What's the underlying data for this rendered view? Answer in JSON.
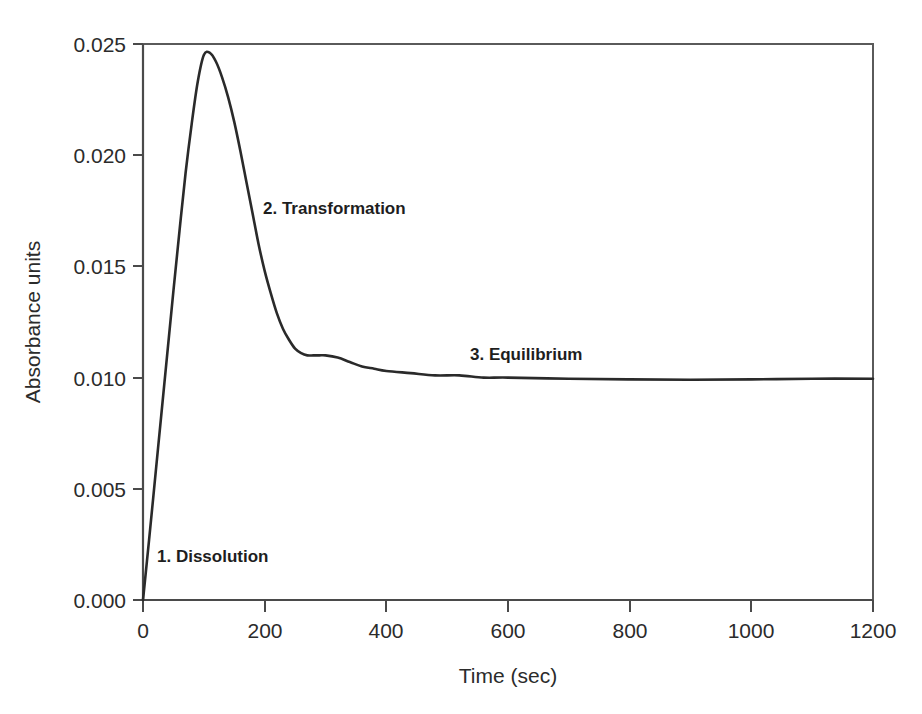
{
  "chart_data": {
    "type": "line",
    "title": "",
    "xlabel": "Time (sec)",
    "ylabel": "Absorbance units",
    "xlim": [
      0,
      1200
    ],
    "ylim": [
      0.0,
      0.025
    ],
    "grid": false,
    "legend": false,
    "x_ticks": [
      0,
      200,
      400,
      600,
      800,
      1000,
      1200
    ],
    "x_tick_labels": [
      "0",
      "200",
      "400",
      "600",
      "800",
      "1000",
      "1200"
    ],
    "y_ticks": [
      0.0,
      0.005,
      0.01,
      0.015,
      0.02,
      0.025
    ],
    "y_tick_labels": [
      "0.000",
      "0.005",
      "0.010",
      "0.015",
      "0.020",
      "0.025"
    ],
    "series": [
      {
        "name": "Absorbance",
        "x": [
          0,
          10,
          20,
          30,
          40,
          50,
          60,
          70,
          80,
          90,
          100,
          110,
          120,
          130,
          140,
          150,
          160,
          170,
          180,
          190,
          200,
          210,
          220,
          230,
          240,
          250,
          260,
          270,
          280,
          290,
          300,
          320,
          340,
          360,
          380,
          400,
          440,
          480,
          520,
          560,
          600,
          700,
          800,
          900,
          1000,
          1100,
          1200
        ],
        "y": [
          0.0,
          0.0027,
          0.0055,
          0.0083,
          0.0111,
          0.0139,
          0.0166,
          0.0192,
          0.0214,
          0.0233,
          0.0245,
          0.0246,
          0.0242,
          0.0235,
          0.0226,
          0.0215,
          0.0202,
          0.0188,
          0.0174,
          0.016,
          0.0148,
          0.0138,
          0.0129,
          0.0122,
          0.0117,
          0.0113,
          0.0111,
          0.011,
          0.011,
          0.011,
          0.011,
          0.0109,
          0.0107,
          0.0105,
          0.0104,
          0.0103,
          0.0102,
          0.0101,
          0.0101,
          0.01,
          0.01,
          0.00995,
          0.00992,
          0.0099,
          0.00992,
          0.00995,
          0.00995
        ]
      }
    ],
    "annotations": [
      {
        "id": "phase-1",
        "label": "1. Dissolution",
        "x": 40,
        "y": 0.0018
      },
      {
        "id": "phase-2",
        "label": "2. Transformation",
        "x": 230,
        "y": 0.0165
      },
      {
        "id": "phase-3",
        "label": "3. Equilibrium",
        "x": 650,
        "y": 0.0113
      }
    ],
    "colors": {
      "curve": "#2a2a2a",
      "axis": "#4a4a4a",
      "frame": "#5a5a5a",
      "text": "#2b2b2b",
      "background": "#ffffff"
    }
  },
  "axes": {
    "y_title": "Absorbance units",
    "x_title": "Time (sec)",
    "y_labels": [
      "0.025",
      "0.020",
      "0.015",
      "0.010",
      "0.005",
      "0.000"
    ],
    "x_labels": [
      "0",
      "200",
      "400",
      "600",
      "800",
      "1000",
      "1200"
    ]
  },
  "annotations": {
    "phase1": "1. Dissolution",
    "phase2": "2. Transformation",
    "phase3": "3. Equilibrium"
  }
}
